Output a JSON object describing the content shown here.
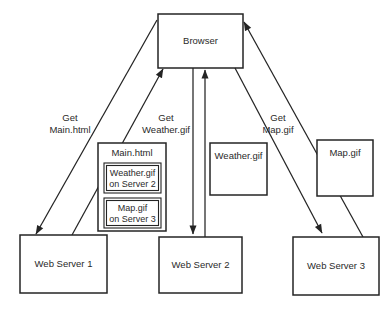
{
  "figure": {
    "background": "#ffffff",
    "line_color": "#242424",
    "text_color": "#2a2a2a",
    "nodes": {
      "browser": {
        "label": "Browser"
      },
      "web_server_1": {
        "label": "Web Server 1"
      },
      "web_server_2": {
        "label": "Web Server 2"
      },
      "web_server_3": {
        "label": "Web Server 3"
      },
      "main_html": {
        "label": "Main.html",
        "items": [
          {
            "line1": "Weather.gif",
            "line2": "on Server 2"
          },
          {
            "line1": "Map.gif",
            "line2": "on Server 3"
          }
        ]
      },
      "weather_gif": {
        "label": "Weather.gif"
      },
      "map_gif": {
        "label": "Map.gif"
      }
    },
    "edge_labels": {
      "get_main_html": {
        "line1": "Get",
        "line2": "Main.html"
      },
      "get_weather_gif": {
        "line1": "Get",
        "line2": "Weather.gif"
      },
      "get_map_gif": {
        "line1": "Get",
        "line2": "Map.gif"
      }
    }
  }
}
